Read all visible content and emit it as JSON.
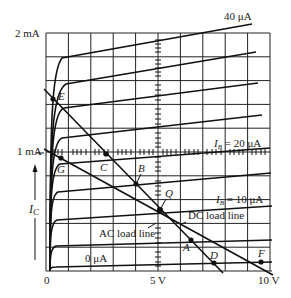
{
  "diagram": {
    "y_axis": {
      "label": "I",
      "label_subscript": "C",
      "ticks": [
        {
          "label": "2 mA",
          "value_mA": 2
        },
        {
          "label": "1 mA",
          "value_mA": 1
        }
      ]
    },
    "x_axis": {
      "ticks": [
        {
          "label": "0",
          "value_V": 0
        },
        {
          "label": "5 V",
          "value_V": 5
        },
        {
          "label": "10 V",
          "value_V": 10
        }
      ]
    },
    "curve_labels": {
      "top": "40 μA",
      "ib20_prefix": "I",
      "ib20_sub": "B",
      "ib20_value": " = 20 μA",
      "ib10_prefix": "I",
      "ib10_sub": "B",
      "ib10_value": " = 10 μA",
      "bottom": "0 μA"
    },
    "base_currents_uA": [
      0,
      5,
      10,
      15,
      20,
      25,
      30,
      35,
      40
    ],
    "load_lines": {
      "dc_label": "DC load line",
      "ac_label": "AC load line"
    },
    "points": {
      "E": "E",
      "C": "C",
      "G": "G",
      "B": "B",
      "Q": "Q",
      "A": "A",
      "D": "D",
      "F": "F"
    },
    "colors": {
      "ink": "#111111",
      "background": "#ffffff"
    }
  }
}
